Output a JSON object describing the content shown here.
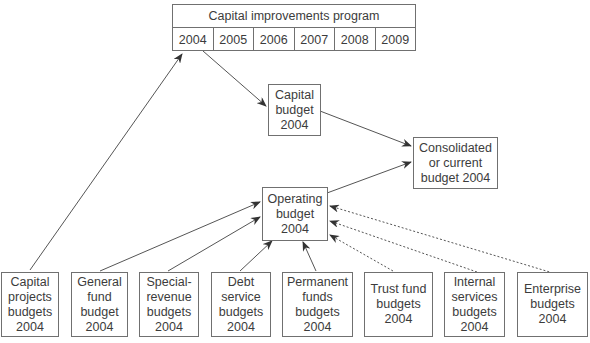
{
  "capital_improvements_program": {
    "title": "Capital improvements program",
    "years": [
      "2004",
      "2005",
      "2006",
      "2007",
      "2008",
      "2009"
    ]
  },
  "capital_budget": {
    "label": "Capital\nbudget\n2004"
  },
  "consolidated_budget": {
    "label": "Consolidated\nor current\nbudget 2004"
  },
  "operating_budget": {
    "label": "Operating\nbudget\n2004"
  },
  "source_budgets": [
    {
      "label": "Capital\nprojects\nbudgets\n2004"
    },
    {
      "label": "General\nfund\nbudget\n2004"
    },
    {
      "label": "Special-\nrevenue\nbudgets\n2004"
    },
    {
      "label": "Debt\nservice\nbudgets\n2004"
    },
    {
      "label": "Permanent\nfunds\nbudgets\n2004"
    },
    {
      "label": "Trust fund\nbudgets\n2004"
    },
    {
      "label": "Internal\nservices\nbudgets\n2004"
    },
    {
      "label": "Enterprise\nbudgets\n2004"
    }
  ],
  "colors": {
    "line": "#555555",
    "border": "#707070",
    "text": "#3c3c3c"
  }
}
